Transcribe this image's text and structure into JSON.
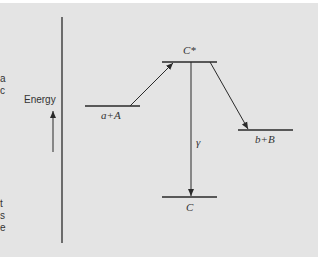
{
  "diagram": {
    "axis_label": "Energy",
    "levels": [
      {
        "id": "aA",
        "label": "a+A"
      },
      {
        "id": "Cstar",
        "label": "C*"
      },
      {
        "id": "bB",
        "label": "b+B"
      },
      {
        "id": "C",
        "label": "C"
      }
    ],
    "transition_label": "γ",
    "left_text_fragments": [
      "a",
      "c",
      "t",
      "s",
      "e"
    ]
  },
  "colors": {
    "panel": "#e4e4e4",
    "line": "#2a2a2a"
  }
}
